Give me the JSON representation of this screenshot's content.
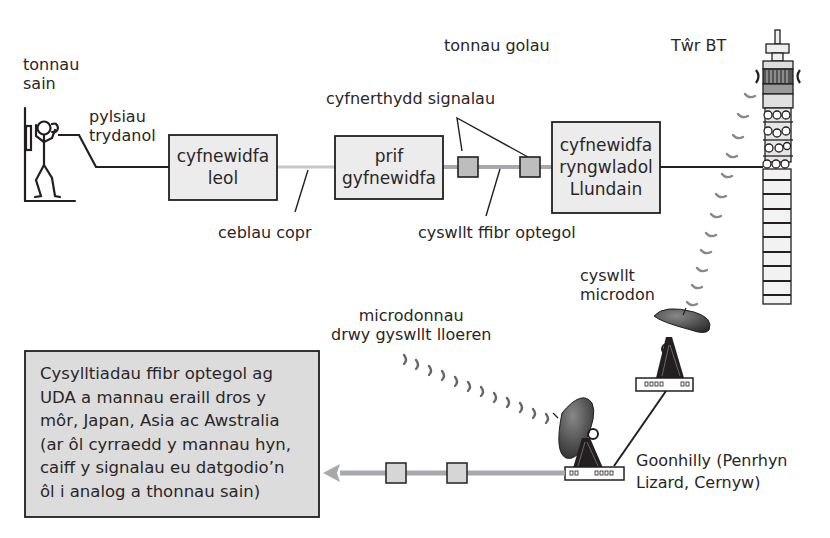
{
  "diagram": {
    "type": "telecommunications-network-flow",
    "language": "Welsh",
    "labels": {
      "sound_waves": [
        "tonnau",
        "sain"
      ],
      "electrical_pulses": [
        "pylsiau",
        "trydanol"
      ],
      "light_waves": "tonnau golau",
      "bt_tower": "Tŵr BT",
      "signal_boosters": "cyfnerthydd signalau",
      "copper_cables": "ceblau copr",
      "optical_fibre_link": "cyswllt ffibr optegol",
      "microwave_link": [
        "cyswllt",
        "microdon"
      ],
      "satellite_microwaves": [
        "microdonnau",
        "drwy gyswllt lloeren"
      ],
      "goonhilly": [
        "Goonhilly (Penrhyn",
        "Lizard, Cernyw)"
      ]
    },
    "boxes": {
      "local_exchange": [
        "cyfnewidfa",
        "leol"
      ],
      "main_exchange": [
        "prif",
        "gyfnewidfa"
      ],
      "london_international_exchange": [
        "cyfnewidfa",
        "ryngwladol",
        "Llundain"
      ]
    },
    "info_box": {
      "lines": [
        "Cysylltiadau ffibr optegol ag",
        "UDA a mannau eraill dros y",
        "môr, Japan, Asia ac Awstralia",
        "(ar ôl cyrraedd y mannau hyn,",
        "caiff y signalau eu datgodio’n",
        "ôl i analog a thonnau sain)"
      ]
    },
    "colors": {
      "line_dark": "#231f20",
      "fibre_grey": "#a7a9ac",
      "copper_grey": "#c8c8c8",
      "box_fill": "#ececec",
      "booster_fill": "#bdbdbd",
      "info_fill": "#dcdcdc"
    }
  }
}
